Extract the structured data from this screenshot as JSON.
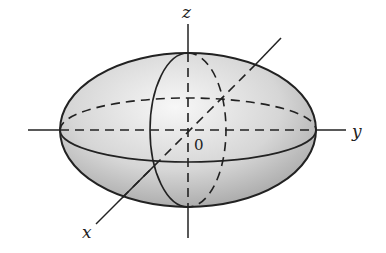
{
  "figure": {
    "labels": {
      "z_axis": "z",
      "y_axis": "y",
      "x_axis": "x",
      "origin": "0"
    },
    "colors": {
      "stroke": "#222222",
      "fill_light": "#f4f4f4",
      "fill_dark": "#a8a8a8",
      "background": "#ffffff"
    }
  }
}
